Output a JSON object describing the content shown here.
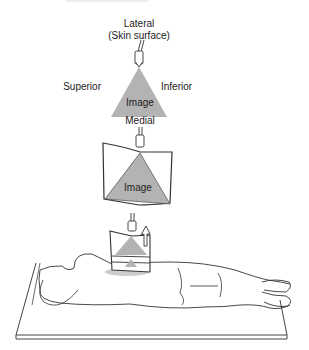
{
  "diagram": {
    "top_view": {
      "label_top_line1": "Lateral",
      "label_top_line2": "(Skin surface)",
      "label_left": "Superior",
      "label_right": "Inferior",
      "label_image": "Image",
      "label_bottom": "Medial"
    },
    "middle_view": {
      "label_image": "Image"
    },
    "colors": {
      "image_fill": "#b3b3b3",
      "line": "#333333",
      "background": "#ffffff"
    }
  }
}
